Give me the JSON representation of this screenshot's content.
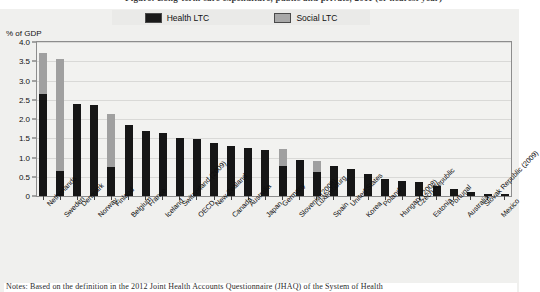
{
  "figure": {
    "title": "Figure: Long-term care expenditure, public and private, 2011 (or nearest year)",
    "axis_title": "% of GDP",
    "note": "Notes: Based on the definition in the 2012 Joint Health Accounts Questionnaire (JHAQ) of the System of Health"
  },
  "legend": {
    "position": "top-center",
    "entries": [
      {
        "label": "Health LTC",
        "color": "#1a1a1a",
        "icon": "legend-swatch-health"
      },
      {
        "label": "Social LTC",
        "color": "#a8a8a8",
        "icon": "legend-swatch-social"
      }
    ]
  },
  "chart_data": {
    "type": "bar",
    "stacked": true,
    "title": "Long-term care expenditure, public and private, 2011 (or nearest year)",
    "xlabel": "",
    "ylabel": "% of GDP",
    "ylim": [
      0,
      4.0
    ],
    "yticks": [
      "0",
      "0.5",
      "1.0",
      "1.5",
      "2.0",
      "2.5",
      "3.0",
      "3.5",
      "4.0"
    ],
    "ytick_values": [
      0,
      0.5,
      1.0,
      1.5,
      2.0,
      2.5,
      3.0,
      3.5,
      4.0
    ],
    "grid": true,
    "legend_position": "top",
    "categories": [
      "Netherlands",
      "Sweden",
      "Denmark",
      "Norway",
      "Finland",
      "Belgium",
      "France",
      "Iceland",
      "Switzerland (2009)",
      "OECD",
      "New Zealand",
      "Canada",
      "Australia",
      "Japan",
      "Germany",
      "Slovenia (2008)",
      "Luxembourg",
      "Spain",
      "United States",
      "Korea",
      "Poland",
      "Hungary (2008)",
      "Czech Republic",
      "Estonia",
      "Portugal",
      "Australia",
      "Slovak Republic (2009)",
      "Mexico"
    ],
    "series": [
      {
        "name": "Health LTC",
        "color": "#161616",
        "values": [
          2.66,
          0.64,
          2.39,
          2.36,
          0.75,
          1.85,
          1.7,
          1.63,
          1.5,
          1.47,
          1.38,
          1.3,
          1.25,
          1.19,
          0.78,
          0.93,
          0.63,
          0.79,
          0.71,
          0.56,
          0.43,
          0.38,
          0.36,
          0.25,
          0.19,
          0.11,
          0.06,
          0.05
        ]
      },
      {
        "name": "Social LTC",
        "color": "#a0a0a0",
        "values": [
          1.06,
          2.92,
          0.0,
          0.0,
          1.37,
          0.0,
          0.0,
          0.0,
          0.0,
          0.0,
          0.0,
          0.0,
          0.0,
          0.0,
          0.45,
          0.0,
          0.27,
          0.0,
          0.0,
          0.0,
          0.0,
          0.0,
          0.0,
          0.0,
          0.0,
          0.0,
          0.0,
          0.0
        ]
      }
    ],
    "totals": [
      3.72,
      3.56,
      2.39,
      2.36,
      2.12,
      1.85,
      1.7,
      1.63,
      1.5,
      1.47,
      1.38,
      1.3,
      1.25,
      1.19,
      1.23,
      0.93,
      0.9,
      0.79,
      0.71,
      0.56,
      0.43,
      0.38,
      0.36,
      0.25,
      0.19,
      0.11,
      0.06,
      0.05
    ]
  }
}
